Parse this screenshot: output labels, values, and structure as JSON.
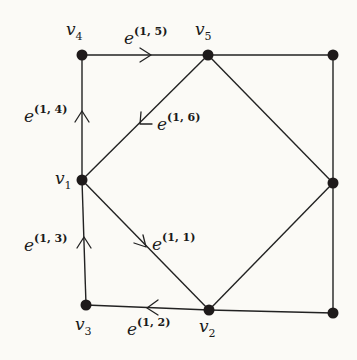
{
  "diagram": {
    "type": "graph",
    "nodes": [
      {
        "id": "v4",
        "label_main": "v",
        "label_sub": "4",
        "x": 82,
        "y": 55
      },
      {
        "id": "v5",
        "label_main": "v",
        "label_sub": "5",
        "x": 208,
        "y": 55
      },
      {
        "id": "n_tr",
        "label_main": "",
        "label_sub": "",
        "x": 333,
        "y": 55
      },
      {
        "id": "v1",
        "label_main": "v",
        "label_sub": "1",
        "x": 82,
        "y": 180
      },
      {
        "id": "n_mr",
        "label_main": "",
        "label_sub": "",
        "x": 333,
        "y": 183
      },
      {
        "id": "v3",
        "label_main": "v",
        "label_sub": "3",
        "x": 86,
        "y": 305
      },
      {
        "id": "v2",
        "label_main": "v",
        "label_sub": "2",
        "x": 209,
        "y": 310
      },
      {
        "id": "n_br",
        "label_main": "",
        "label_sub": "",
        "x": 333,
        "y": 313
      }
    ],
    "directed_edges": [
      {
        "id": "e15",
        "from": "v4",
        "to": "v5",
        "label_main": "e",
        "label_sup": "(1, 5)"
      },
      {
        "id": "e16",
        "from": "v5",
        "to": "v1",
        "label_main": "e",
        "label_sup": "(1, 6)"
      },
      {
        "id": "e14",
        "from": "v1",
        "to": "v4",
        "label_main": "e",
        "label_sup": "(1, 4)"
      },
      {
        "id": "e13",
        "from": "v3",
        "to": "v1",
        "label_main": "e",
        "label_sup": "(1, 3)"
      },
      {
        "id": "e11",
        "from": "v1",
        "to": "v2",
        "label_main": "e",
        "label_sup": "(1, 1)"
      },
      {
        "id": "e12",
        "from": "v2",
        "to": "v3",
        "label_main": "e",
        "label_sup": "(1, 2)"
      }
    ],
    "undirected_edges": [
      {
        "from": "v5",
        "to": "n_tr"
      },
      {
        "from": "n_tr",
        "to": "n_mr"
      },
      {
        "from": "n_mr",
        "to": "n_br"
      },
      {
        "from": "v2",
        "to": "n_br"
      },
      {
        "from": "v5",
        "to": "n_mr"
      },
      {
        "from": "v2",
        "to": "n_mr"
      }
    ],
    "colors": {
      "background": "#fbfaf6",
      "ink": "#1e1a1a"
    }
  }
}
